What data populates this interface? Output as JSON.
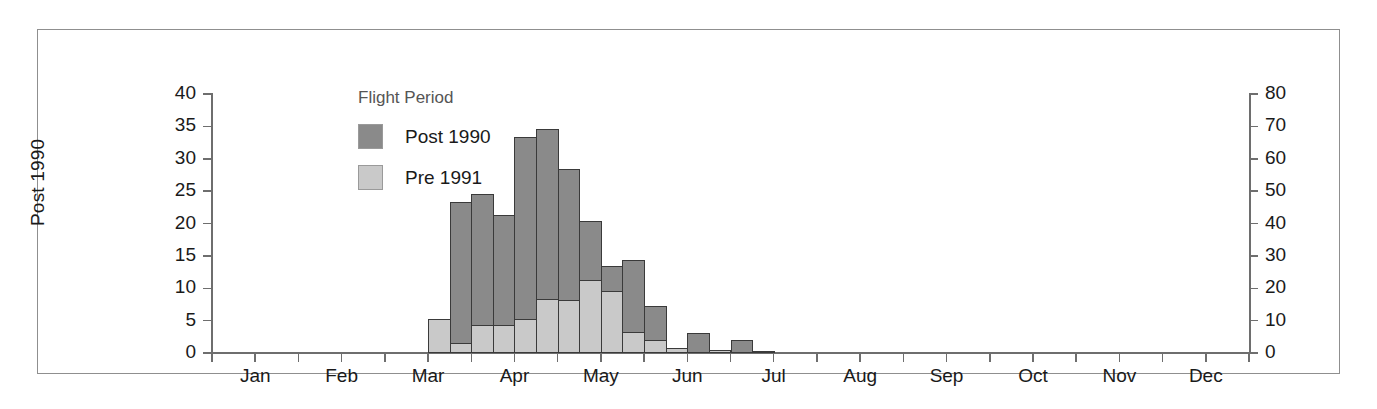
{
  "chart_data": {
    "type": "bar",
    "title": "",
    "subtitle": "",
    "xlabel": "",
    "ylabel": "Post 1990",
    "y2label": "Pre 1991",
    "ylim": [
      0,
      40
    ],
    "y2lim": [
      0,
      80
    ],
    "grid": false,
    "legend_position": "upper-left",
    "legend_title": "Flight Period",
    "x_tick_labels": [
      "Jan",
      "Feb",
      "Mar",
      "Apr",
      "May",
      "Jun",
      "Jul",
      "Aug",
      "Sep",
      "Oct",
      "Nov",
      "Dec"
    ],
    "x_minor_ticks_per_category": 2,
    "y_tick_labels": [
      "0",
      "5",
      "10",
      "15",
      "20",
      "25",
      "30",
      "35",
      "40"
    ],
    "y_tick_values": [
      0,
      5,
      10,
      15,
      20,
      25,
      30,
      35,
      40
    ],
    "y2_tick_labels": [
      "0",
      "10",
      "20",
      "30",
      "40",
      "50",
      "60",
      "70",
      "80"
    ],
    "y2_tick_values": [
      0,
      10,
      20,
      30,
      40,
      50,
      60,
      70,
      80
    ],
    "bin_description": "half-month bins",
    "bins": [
      "Jan-1",
      "Jan-2",
      "Feb-1",
      "Feb-2",
      "Mar-1",
      "Mar-2",
      "Apr-1",
      "Apr-2",
      "May-1",
      "May-2",
      "Jun-1",
      "Jun-2",
      "Jul-1",
      "Jul-2",
      "Aug-1",
      "Aug-2",
      "Sep-1",
      "Sep-2",
      "Oct-1",
      "Oct-2",
      "Nov-1",
      "Nov-2",
      "Dec-1",
      "Dec-2"
    ],
    "series": [
      {
        "name": "Post 1990",
        "color": "#8a8a8a",
        "axis": "left",
        "values": [
          0,
          0,
          0,
          0,
          0,
          0,
          0,
          0,
          0,
          0,
          0,
          23.4,
          24.5,
          21.3,
          33.4,
          34.6,
          28.4,
          20.4,
          13.4,
          14.3,
          7.2,
          0,
          3.1,
          0.5,
          2.0,
          0.2,
          0,
          0,
          0,
          0,
          0,
          0
        ]
      },
      {
        "name": "Pre 1991",
        "color": "#c9c9c9",
        "axis": "right",
        "values": [
          0,
          0,
          0,
          0,
          0,
          0,
          0,
          0,
          0,
          0,
          10.4,
          3.0,
          8.6,
          8.8,
          10.6,
          16.6,
          16.4,
          22.6,
          19.2,
          6.4,
          4.0,
          1.6,
          0,
          0.8,
          0,
          0,
          0,
          0,
          0,
          0,
          0,
          0
        ]
      }
    ],
    "bars": [
      {
        "x_index": 10,
        "post_1990": 0,
        "pre_1991": 10.4
      },
      {
        "x_index": 11,
        "post_1990": 23.4,
        "pre_1991": 3.0
      },
      {
        "x_index": 12,
        "post_1990": 24.5,
        "pre_1991": 8.6
      },
      {
        "x_index": 13,
        "post_1990": 21.3,
        "pre_1991": 8.8
      },
      {
        "x_index": 14,
        "post_1990": 33.4,
        "pre_1991": 10.6
      },
      {
        "x_index": 15,
        "post_1990": 34.6,
        "pre_1991": 16.6
      },
      {
        "x_index": 16,
        "post_1990": 28.4,
        "pre_1991": 16.4
      },
      {
        "x_index": 17,
        "post_1990": 20.4,
        "pre_1991": 22.6
      },
      {
        "x_index": 18,
        "post_1990": 13.4,
        "pre_1991": 19.2
      },
      {
        "x_index": 19,
        "post_1990": 14.3,
        "pre_1991": 6.4
      },
      {
        "x_index": 20,
        "post_1990": 7.2,
        "pre_1991": 4.0
      },
      {
        "x_index": 21,
        "post_1990": 0,
        "pre_1991": 1.6
      },
      {
        "x_index": 22,
        "post_1990": 3.1,
        "pre_1991": 0
      },
      {
        "x_index": 23,
        "post_1990": 0.5,
        "pre_1991": 0.8
      },
      {
        "x_index": 24,
        "post_1990": 2.0,
        "pre_1991": 0
      },
      {
        "x_index": 25,
        "post_1990": 0.2,
        "pre_1991": 0
      }
    ]
  },
  "legend": {
    "title": "Flight Period",
    "items": [
      {
        "label": "Post 1990",
        "color": "#8a8a8a"
      },
      {
        "label": "Pre 1991",
        "color": "#c9c9c9"
      }
    ]
  },
  "axes": {
    "left_title": "Post 1990",
    "right_title": "Pre 1991"
  },
  "colors": {
    "post_1990": "#8a8a8a",
    "pre_1991": "#c9c9c9",
    "bar_outline": "#3a3a3a",
    "axis": "#6e6e6e",
    "frame": "#8f8f8f",
    "text": "#1a1a1a",
    "legend_title": "#555555",
    "background": "#ffffff"
  }
}
